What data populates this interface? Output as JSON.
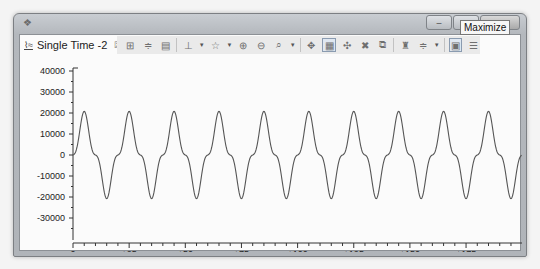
{
  "window": {
    "app_icon": "app-icon",
    "controls": {
      "minimize": "–",
      "maximize": "□",
      "close": "✕"
    },
    "tooltip": "Maximize"
  },
  "tab": {
    "icon": "waveform-icon",
    "label": "Single Time -2",
    "close": "☒"
  },
  "toolbar": {
    "icons": [
      {
        "name": "fit-all-icon",
        "glyph": "⊞"
      },
      {
        "name": "fit-vertical-icon",
        "glyph": "≑"
      },
      {
        "name": "zoom-box-icon",
        "glyph": "▤"
      },
      {
        "name": "cursor-icon",
        "glyph": "⊥",
        "dropdown": true
      },
      {
        "name": "marker-icon",
        "glyph": "☆",
        "dropdown": true
      },
      {
        "name": "zoom-in-icon",
        "glyph": "⊕"
      },
      {
        "name": "zoom-out-icon",
        "glyph": "⊖"
      },
      {
        "name": "zoom-tool-icon",
        "glyph": "⌕",
        "dropdown": true
      },
      {
        "name": "pan-icon",
        "glyph": "✥"
      },
      {
        "name": "grid-view-icon",
        "glyph": "▦",
        "active": true
      },
      {
        "name": "snap-icon",
        "glyph": "✣"
      },
      {
        "name": "settings-cross-icon",
        "glyph": "✖"
      },
      {
        "name": "export-icon",
        "glyph": "⧉"
      },
      {
        "name": "find-icon",
        "glyph": "♜"
      },
      {
        "name": "adjust-icon",
        "glyph": "≑",
        "dropdown": true
      },
      {
        "name": "image-view-icon",
        "glyph": "▣",
        "active": true
      },
      {
        "name": "list-icon",
        "glyph": "☰"
      }
    ]
  },
  "chart_data": {
    "type": "line",
    "title": "Single Time -2",
    "xlabel": "sample",
    "ylabel": "",
    "xlim": [
      0,
      200
    ],
    "ylim": [
      -40000,
      40000
    ],
    "yticks": [
      40000,
      30000,
      20000,
      10000,
      0,
      -10000,
      -20000,
      -30000
    ],
    "ytick_labels": [
      "40000",
      "30000",
      "20000",
      "10000",
      "0",
      "-10000",
      "-20000",
      "-30000"
    ],
    "xticks": [
      0,
      25,
      50,
      75,
      100,
      125,
      150,
      175
    ],
    "xtick_labels": [
      "0",
      "+25",
      "+50",
      "+75",
      "+100",
      "+125",
      "+150",
      "+175"
    ],
    "grid": false,
    "legend": null,
    "series": [
      {
        "name": "Single Time -2",
        "description": "periodic waveform, period ~20 samples, peaks ~+21000, troughs ~-21000, shoulders near 0",
        "generator": {
          "period": 20,
          "fundamental_amp": 16000,
          "third_harmonic_amp": -4800,
          "samples": 200
        },
        "peak": 21000,
        "trough": -21000,
        "color": "#555555"
      }
    ]
  }
}
